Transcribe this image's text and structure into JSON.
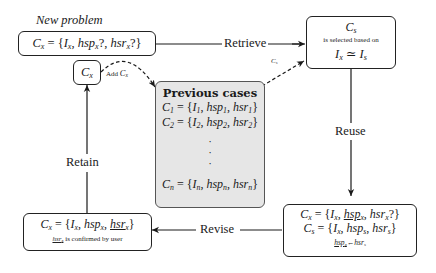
{
  "diagram": {
    "title_new_problem": "New problem",
    "new_problem": {
      "lhs": "C",
      "lhs_sub": "x",
      "eq": " = {",
      "items": [
        {
          "t": "I",
          "s": "x",
          "after": ", "
        },
        {
          "t": "hsp",
          "s": "x",
          "after": "?, "
        },
        {
          "t": "hsr",
          "s": "x",
          "after": "?}"
        }
      ]
    },
    "retrieved": {
      "title": "C",
      "title_sub": "s",
      "caption": "is selected based on",
      "relation_lhs": "I",
      "relation_lhs_sub": "x",
      "relation_op": " ≃ ",
      "relation_rhs": "I",
      "relation_rhs_sub": "s"
    },
    "previous_cases": {
      "title": "Previous cases",
      "rows": [
        {
          "c": "C",
          "cs": "1",
          "i": "I",
          "is": "1",
          "p": "hsp",
          "ps": "1",
          "r": "hsr",
          "rs": "1"
        },
        {
          "c": "C",
          "cs": "2",
          "i": "I",
          "is": "2",
          "p": "hsp",
          "ps": "2",
          "r": "hsr",
          "rs": "2"
        },
        {
          "c": "C",
          "cs": "n",
          "i": "I",
          "is": "n",
          "p": "hsp",
          "ps": "n",
          "r": "hsr",
          "rs": "n"
        }
      ],
      "ellipsis": [
        "·",
        "·",
        "·"
      ],
      "fill_color": "#e6e6e6"
    },
    "reuse_box": {
      "line1": {
        "c": "C",
        "cs": "x",
        "i": "I",
        "is": "x",
        "p": "hsp",
        "ps": "x",
        "r": "hsr",
        "rs": "x",
        "suffix": "?}"
      },
      "line2": {
        "c": "C",
        "cs": "s",
        "i": "I",
        "is": "x",
        "p": "hsp",
        "ps": "s",
        "r": "hsr",
        "rs": "s"
      },
      "assign_lhs": "hsp",
      "assign_lhs_sub": "x",
      "assign_op": "←",
      "assign_rhs": "hsr",
      "assign_rhs_sub": "s"
    },
    "revised_box": {
      "c": "C",
      "cs": "x",
      "i": "I",
      "is": "x",
      "p": "hsp",
      "ps": "x",
      "r": "hsr",
      "rs": "x",
      "note_var": "hsr",
      "note_var_sub": "x",
      "note_text": " is confirmed by user"
    },
    "retained_box": {
      "c": "C",
      "cs": "x"
    },
    "edges": {
      "retrieve": "Retrieve",
      "reuse": "Reuse",
      "revise": "Revise",
      "retain": "Retain",
      "add": "Add ",
      "add_var": "C",
      "add_var_sub": "x",
      "cs_var": "C",
      "cs_var_sub": "s"
    }
  }
}
